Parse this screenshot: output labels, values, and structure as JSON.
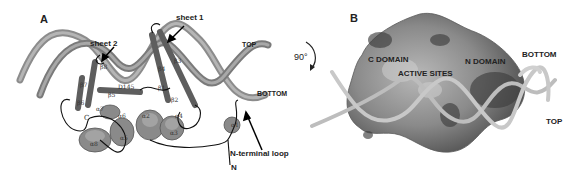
{
  "figure": {
    "panels": [
      {
        "letter": "A",
        "type": "ribbon-diagram",
        "labels": {
          "sheet1": "sheet 1",
          "sheet2": "sheet 2",
          "top": "TOP",
          "bottom": "BOTTOM",
          "n_terminal_loop": "N-terminal loop",
          "n_terminus": "N",
          "c_terminus": "C",
          "residue": "D145"
        },
        "secondary_structure": {
          "strands": [
            "β1",
            "β2",
            "β3",
            "β4",
            "β5",
            "β6",
            "β7",
            "β8"
          ],
          "helices": [
            "α1",
            "α2",
            "α3",
            "α4",
            "α5",
            "α6",
            "α7",
            "α8"
          ]
        }
      },
      {
        "letter": "B",
        "type": "surface-rendering",
        "rotation": "90°",
        "labels": {
          "c_domain": "C DOMAIN",
          "n_domain": "N DOMAIN",
          "active_sites": "ACTIVE SITES",
          "bottom": "BOTTOM",
          "top": "TOP"
        }
      }
    ]
  }
}
